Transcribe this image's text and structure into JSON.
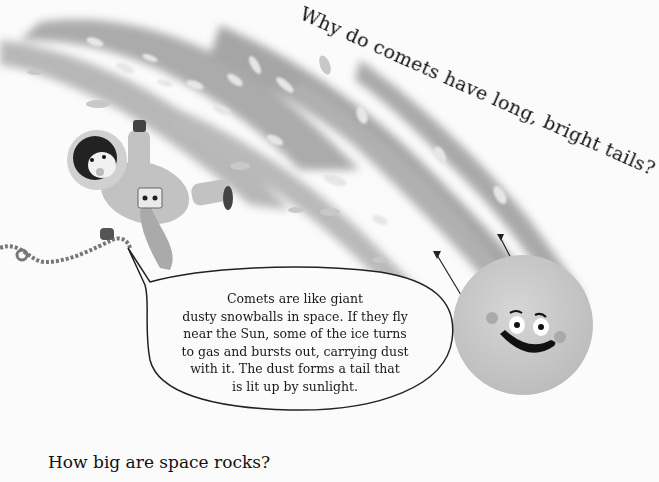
{
  "page": {
    "heading": "Why do comets have long, bright tails?",
    "speech_bubble": {
      "lines": [
        "Comets are like giant",
        "dusty snowballs in space. If they fly",
        "near the Sun, some of the ice turns",
        "to gas and bursts out, carrying dust",
        "with it. The dust forms a tail that",
        "is lit up by sunlight."
      ]
    },
    "next_section_heading": "How big are space rocks?"
  },
  "illustration": {
    "figures": [
      "astronaut-with-tether",
      "smiling-comet",
      "comet-tail-streaks"
    ],
    "palette": {
      "background": "#fbfbfb",
      "tail_dark": "#9a9a9a",
      "tail_light": "#c4c4c4",
      "comet_body": "#cfcfcf",
      "ink": "#111111"
    }
  }
}
